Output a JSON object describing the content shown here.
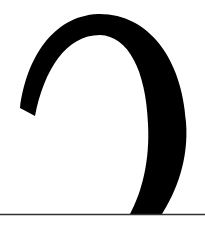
{
  "figure": {
    "description": "Cropped close-up of a large black serif glyph stroke resting on a horizontal baseline rule",
    "glyph": {
      "shape": "hook-arc",
      "fill": "#000000"
    },
    "baseline": {
      "y": 214,
      "color": "#333333",
      "thickness": 1.5
    },
    "background": "#ffffff"
  }
}
